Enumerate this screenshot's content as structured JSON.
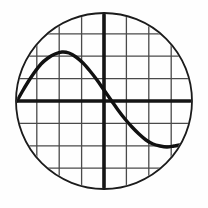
{
  "figure": {
    "type_label": "circular-grid-plot",
    "background_color": "#fefefe",
    "circle": {
      "name": "clipping-circle",
      "center_x": 104,
      "center_y": 101,
      "radius": 88,
      "stroke_color": "#1b1b1b",
      "stroke_width": 1.8
    },
    "grid": {
      "visible": true,
      "spacing_px": 22.4,
      "stroke_color": "#4a4a4a",
      "stroke_width": 1.3,
      "vertical_positions": [
        14.4,
        36.8,
        59.2,
        81.6,
        104,
        126.4,
        148.8,
        171.2,
        193.6
      ],
      "horizontal_positions": [
        11.4,
        33.8,
        56.2,
        78.6,
        101,
        123.4,
        145.8,
        168.2,
        190.6
      ]
    },
    "axes": {
      "x_axis_y": 101,
      "y_axis_x": 104,
      "stroke_color": "#151515",
      "stroke_width": 3.6,
      "x_label": "",
      "y_label": "",
      "tick_labels": []
    }
  },
  "chart_data": {
    "type": "line",
    "subtitle": "",
    "xlabel": "",
    "ylabel": "",
    "xlim": [
      -4.0,
      4.0
    ],
    "ylim": [
      -4.0,
      4.0
    ],
    "grid": true,
    "legend_position": "none",
    "legend_entries": [],
    "annotations": [],
    "series": [
      {
        "name": "curve",
        "color": "#111111",
        "points_px": [
          [
            17,
            101
          ],
          [
            22,
            92
          ],
          [
            28,
            82
          ],
          [
            34,
            73
          ],
          [
            41,
            64
          ],
          [
            48,
            58
          ],
          [
            55,
            54
          ],
          [
            62,
            52
          ],
          [
            69,
            53
          ],
          [
            76,
            57
          ],
          [
            83,
            63
          ],
          [
            90,
            71
          ],
          [
            97,
            80
          ],
          [
            104,
            90
          ],
          [
            111,
            100
          ],
          [
            118,
            110
          ],
          [
            125,
            119
          ],
          [
            132,
            127
          ],
          [
            139,
            134
          ],
          [
            146,
            140
          ],
          [
            153,
            144
          ],
          [
            160,
            146
          ],
          [
            167,
            147
          ],
          [
            174,
            146
          ],
          [
            180,
            145
          ],
          [
            185,
            143
          ]
        ],
        "x": [
          -3.9,
          -3.6,
          -3.3,
          -3.0,
          -2.7,
          -2.4,
          -2.1,
          -1.9,
          -1.6,
          -1.3,
          -1.0,
          -0.6,
          -0.3,
          0.0,
          0.3,
          0.6,
          1.0,
          1.3,
          1.6,
          1.9,
          2.2,
          2.5,
          2.8,
          3.1,
          3.4,
          3.6
        ],
        "y": [
          0.0,
          0.4,
          0.85,
          1.25,
          1.65,
          1.92,
          2.1,
          2.18,
          2.14,
          1.96,
          1.7,
          1.34,
          0.94,
          0.49,
          0.05,
          -0.4,
          -0.8,
          -1.16,
          -1.47,
          -1.74,
          -1.92,
          -2.0,
          -2.05,
          -2.0,
          -1.96,
          -1.87
        ]
      }
    ]
  }
}
